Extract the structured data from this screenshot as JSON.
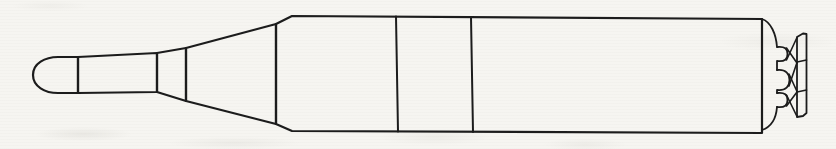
{
  "canvas": {
    "width": 836,
    "height": 149,
    "background": "#f6f5f1",
    "ink": "#1c1c1c",
    "stroke_width": 2
  },
  "drawing": {
    "name": "missile-side-profile",
    "paths": [
      {
        "name": "nose-dome",
        "w": 2.2,
        "d": "M 78 57 L 58 57 C 45 57 33 63.5 33 75 C 33 86.5 45 93 58 93 L 78 93 Z"
      },
      {
        "name": "warhead-section",
        "w": 2.2,
        "d": "M 78 57 L 157 53 L 157 92 L 78 93 Z"
      },
      {
        "name": "adapter-ring",
        "w": 2.2,
        "d": "M 157 53 L 186 48 L 186 101 L 157 92 Z"
      },
      {
        "name": "interstage-cone",
        "w": 2.2,
        "d": "M 186 48 L 276 24 L 276 124 L 186 101 Z"
      },
      {
        "name": "main-body",
        "w": 2.2,
        "d": "M 276 24 L 292 16 L 762 19 L 762 133 L 292 131 L 276 124 Z"
      },
      {
        "name": "body-divider-1",
        "w": 2.0,
        "d": "M 396 16.5 L 398 131.5"
      },
      {
        "name": "body-divider-2",
        "w": 2.0,
        "d": "M 471 17 L 473 132"
      },
      {
        "name": "aft-fairing-top",
        "w": 1.8,
        "d": "M 762 19 C 771 22 776 34 777 47"
      },
      {
        "name": "nozzle-throat-top",
        "w": 1.8,
        "d": "M 777 47 C 785 46 787.5 49 787.5 54 C 787.5 59 785 62 777 61 L 777 70"
      },
      {
        "name": "center-bump",
        "w": 1.8,
        "d": "M 777 70 C 786 69 789.5 74 789.5 80 C 789.5 86 786 91 777 90 L 777 93"
      },
      {
        "name": "nozzle-throat-bottom",
        "w": 1.8,
        "d": "M 777 93 C 785 92 787.5 95 787.5 100 C 787.5 105 785 108 777 107"
      },
      {
        "name": "aft-fairing-bottom",
        "w": 1.8,
        "d": "M 777 107 C 776 120 771 127 762 130"
      },
      {
        "name": "brace-top-a",
        "w": 1.6,
        "d": "M 786.5 48 L 797 63"
      },
      {
        "name": "brace-top-b",
        "w": 1.6,
        "d": "M 786.5 60 L 797 37.5"
      },
      {
        "name": "brace-mid-a",
        "w": 1.6,
        "d": "M 789 74 L 797 91.5"
      },
      {
        "name": "brace-mid-b",
        "w": 1.6,
        "d": "M 789 86 L 797 62.5"
      },
      {
        "name": "brace-bottom-a",
        "w": 1.6,
        "d": "M 786.5 95 L 797 116.5"
      },
      {
        "name": "brace-bottom-b",
        "w": 1.6,
        "d": "M 786.5 106 L 797 92"
      },
      {
        "name": "exit-ring",
        "w": 1.8,
        "d": "M 797 37 L 803 33.5 L 806.5 34 L 806.5 113 L 803 116 L 797 117 Z"
      },
      {
        "name": "exit-ring-divider-1",
        "w": 1.6,
        "d": "M 797 62 L 806.5 60"
      },
      {
        "name": "exit-ring-divider-2",
        "w": 1.6,
        "d": "M 797 92 L 806.5 90"
      }
    ]
  }
}
